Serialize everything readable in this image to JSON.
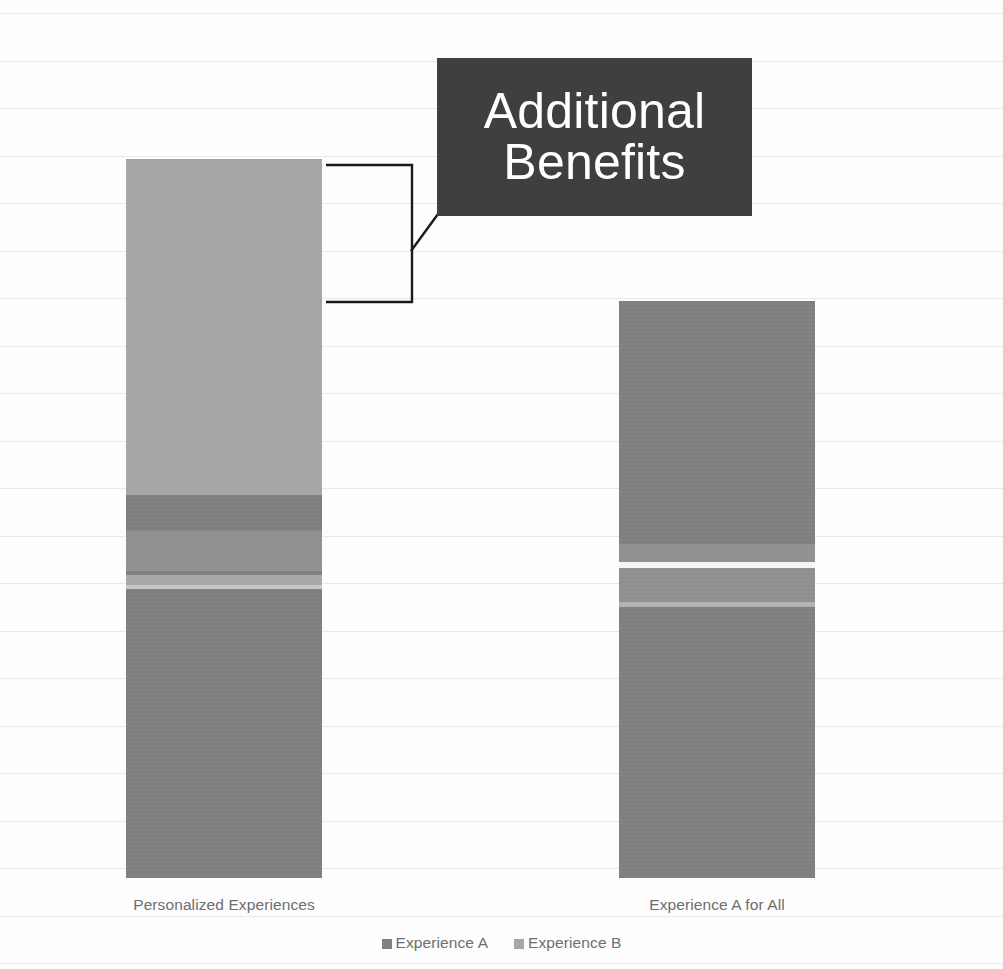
{
  "chart_data": {
    "type": "bar",
    "subtype": "stacked-column",
    "title": "",
    "xlabel": "",
    "ylabel": "",
    "grid": true,
    "legend_position": "bottom",
    "categories": [
      "Personalized Experiences",
      "Experience A for All"
    ],
    "series": [
      {
        "name": "Experience A",
        "color": "#7f7f7f",
        "values": [
          53.3,
          80.3
        ]
      },
      {
        "name": "Experience B",
        "color": "#a6a6a6",
        "values": [
          46.7,
          0
        ]
      }
    ],
    "annotations": [
      {
        "name": "additional-benefits-callout",
        "text_lines": [
          "Additional",
          "Benefits"
        ],
        "style": "dark-box-white-text",
        "box_color": "#3f3f3f",
        "text_color": "#ffffff",
        "points_at": "Experience B segment of Personalized Experiences"
      }
    ]
  },
  "chart": {
    "background": "#fdfdfd",
    "gridline_color": "#e9e9ea",
    "label_color": "#6e6e6e",
    "bars": [
      {
        "name": "personalized-experiences",
        "label": "Personalized Experiences",
        "left": 126,
        "width": 196,
        "segments": [
          {
            "name": "experience-b",
            "series": "Experience B",
            "top": 159,
            "height": 336,
            "color": "#a6a6a6"
          },
          {
            "name": "experience-a",
            "series": "Experience A",
            "top": 495,
            "height": 383,
            "color": "#7f7f7f"
          }
        ]
      },
      {
        "name": "experience-a-for-all",
        "label": "Experience A for All",
        "left": 619,
        "width": 196,
        "segments": [
          {
            "name": "experience-a",
            "series": "Experience A",
            "top": 301,
            "height": 577,
            "color": "#7f7f7f"
          }
        ]
      }
    ],
    "legend": [
      {
        "name": "Experience A",
        "color": "#7f7f7f"
      },
      {
        "name": "Experience B",
        "color": "#a6a6a6"
      }
    ]
  },
  "callout": {
    "line1": "Additional",
    "line2": "Benefits",
    "box_color": "#3f3f3f",
    "text_color": "#ffffff"
  },
  "axis_labels": {
    "cat1": "Personalized Experiences",
    "cat2": "Experience A for All"
  },
  "legend_labels": {
    "series_a": "Experience A",
    "series_b": "Experience B"
  }
}
